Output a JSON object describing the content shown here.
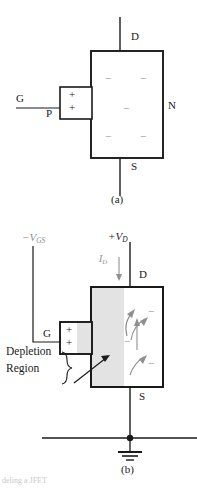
{
  "figure": {
    "caption_partial": "deling a JFET",
    "panels": [
      {
        "id": "a",
        "label": "(a)",
        "terminals": {
          "drain": "D",
          "source": "S",
          "gate": "G"
        },
        "channel_label": "N",
        "gate_material_label": "P",
        "gate_charges": [
          "+",
          "+"
        ],
        "channel_charges": [
          "−",
          "−",
          "−",
          "−",
          "−"
        ],
        "description": "Unbiased JFET: N channel with free electrons, P gate with holes"
      },
      {
        "id": "b",
        "label": "(b)",
        "terminals": {
          "drain": "D",
          "source": "S",
          "gate": "G"
        },
        "supply_gate_label": "−V",
        "supply_gate_sub": "GS",
        "supply_drain_label": "+V",
        "supply_drain_sub": "D",
        "current_label": "I",
        "current_sub": "D",
        "depletion_label_line1": "Depletion",
        "depletion_label_line2": "Region",
        "gate_charges": [
          "+",
          "+"
        ],
        "channel_charges": [
          "−",
          "−",
          "−"
        ],
        "ground_symbol": "earth-ground",
        "description": "Reverse-biased JFET showing depletion region and drain current"
      }
    ]
  },
  "colors": {
    "ink": "#1a1a1a",
    "faint_ink": "#8f8f8f",
    "depletion_fill": "#e3e3e3",
    "paper": "#ffffff"
  }
}
